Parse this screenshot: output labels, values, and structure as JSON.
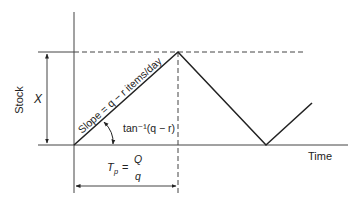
{
  "diagram": {
    "type": "inventory-cycle (stock vs time, production build-up then depletion)",
    "axes": {
      "y_label": "Stock",
      "x_label": "Time"
    },
    "annotations": {
      "max_stock_label": "X",
      "slope_label": "Slope = q − r items/day",
      "angle_label": "tan⁻¹(q − r)",
      "period_label_lhs": "T",
      "period_label_sub": "p",
      "period_label_eq": "=",
      "period_label_num": "Q",
      "period_label_den": "q"
    },
    "geometry": {
      "origin": [
        74,
        145
      ],
      "peak": [
        178,
        52
      ],
      "trough": [
        266,
        145
      ],
      "end": [
        312,
        103
      ]
    },
    "colors": {
      "line": "#222222",
      "background": "#ffffff"
    }
  }
}
